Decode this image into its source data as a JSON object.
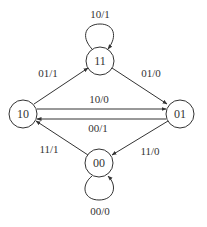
{
  "diagram": {
    "type": "state-machine",
    "states": [
      {
        "id": "11",
        "label": "11"
      },
      {
        "id": "10",
        "label": "10"
      },
      {
        "id": "01",
        "label": "01"
      },
      {
        "id": "00",
        "label": "00"
      }
    ],
    "transitions": [
      {
        "from": "11",
        "to": "11",
        "label": "10/1"
      },
      {
        "from": "10",
        "to": "11",
        "label": "01/1"
      },
      {
        "from": "11",
        "to": "01",
        "label": "01/0"
      },
      {
        "from": "10",
        "to": "01",
        "label": "10/0"
      },
      {
        "from": "01",
        "to": "10",
        "label": "00/1"
      },
      {
        "from": "00",
        "to": "10",
        "label": "11/1"
      },
      {
        "from": "01",
        "to": "00",
        "label": "11/0"
      },
      {
        "from": "00",
        "to": "00",
        "label": "00/0"
      }
    ],
    "colors": {
      "stroke": "#333333",
      "background": "#ffffff"
    }
  }
}
